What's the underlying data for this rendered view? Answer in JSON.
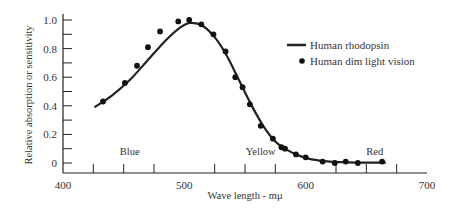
{
  "chart_data": {
    "type": "line",
    "title": "",
    "xlabel": "Wave length - mμ",
    "ylabel": "Relative absorption or sensitivity",
    "xlim": [
      400,
      700
    ],
    "ylim": [
      0,
      1.0
    ],
    "x_ticks": [
      400,
      500,
      600,
      700
    ],
    "x_minor_ticks": [
      425,
      450,
      475,
      525,
      550,
      575,
      625,
      650,
      675
    ],
    "y_ticks": [
      0,
      0.2,
      0.4,
      0.6,
      0.8,
      1.0
    ],
    "y_tick_labels": [
      "0",
      "0.2",
      "0.4",
      "0.6",
      "0.8",
      "1.0"
    ],
    "y_minor_ticks": [
      0.1,
      0.3,
      0.5,
      0.7,
      0.9
    ],
    "grid": false,
    "legend_position": "upper right",
    "region_labels": [
      {
        "text": "Blue",
        "x": 455,
        "y": 0.08
      },
      {
        "text": "Yellow",
        "x": 563,
        "y": 0.08
      },
      {
        "text": "Red",
        "x": 657,
        "y": 0.08
      }
    ],
    "series": [
      {
        "name": "Human rhodopsin",
        "style": "line",
        "color": "#222222",
        "x": [
          426,
          440,
          455,
          470,
          485,
          497,
          505,
          515,
          525,
          535,
          545,
          555,
          565,
          575,
          585,
          595,
          605,
          620,
          635,
          650,
          666
        ],
        "values": [
          0.39,
          0.47,
          0.58,
          0.72,
          0.86,
          0.95,
          0.98,
          0.96,
          0.88,
          0.75,
          0.58,
          0.41,
          0.26,
          0.15,
          0.09,
          0.05,
          0.025,
          0.01,
          0.005,
          0.003,
          0.003
        ]
      },
      {
        "name": "Human dim light vision",
        "style": "scatter",
        "color": "#111111",
        "x": [
          433,
          451,
          461,
          470,
          480,
          495,
          504,
          514,
          524,
          534,
          542,
          548,
          554,
          563,
          573,
          580,
          583,
          592,
          600,
          614,
          624,
          633,
          643,
          663
        ],
        "values": [
          0.43,
          0.56,
          0.68,
          0.81,
          0.92,
          0.99,
          1.0,
          0.97,
          0.9,
          0.78,
          0.6,
          0.53,
          0.41,
          0.26,
          0.17,
          0.11,
          0.1,
          0.06,
          0.04,
          0.01,
          0.0,
          0.01,
          0.0,
          0.01
        ]
      }
    ]
  },
  "legend": {
    "items": [
      {
        "label": "Human rhodopsin",
        "marker": "line"
      },
      {
        "label": "Human dim light vision",
        "marker": "dot"
      }
    ]
  }
}
